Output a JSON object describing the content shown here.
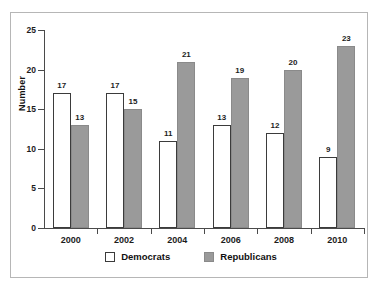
{
  "chart_data": {
    "type": "bar",
    "title": "",
    "subtitle": "",
    "xlabel": "",
    "ylabel": "Number",
    "categories": [
      "2000",
      "2002",
      "2004",
      "2006",
      "2008",
      "2010"
    ],
    "series": [
      {
        "name": "Democrats",
        "color": "#ffffff",
        "values": [
          17,
          17,
          11,
          13,
          12,
          9
        ]
      },
      {
        "name": "Republicans",
        "color": "#9a9a9a",
        "values": [
          13,
          15,
          21,
          19,
          20,
          23
        ]
      }
    ],
    "ylim": [
      0,
      25
    ],
    "yticks": [
      0,
      5,
      10,
      15,
      20,
      25
    ],
    "ytick_labels": [
      "0",
      "5",
      "10",
      "15",
      "20",
      "25"
    ],
    "grid": false,
    "legend_position": "bottom-center",
    "data_labels": true,
    "bar_grouping": "grouped",
    "annotations": []
  },
  "legend": {
    "items": [
      {
        "label": "Democrats",
        "swatch": "legend-swatch-democrats"
      },
      {
        "label": "Republicans",
        "swatch": "legend-swatch-republicans"
      }
    ]
  },
  "colors": {
    "democrats_fill": "#ffffff",
    "democrats_edge": "#3b3b3b",
    "republicans_fill": "#9a9a9a",
    "republicans_edge": "#8a8a8a",
    "axis": "#4a4a4a",
    "frame": "#b6b6b6",
    "text": "#1c1c1c"
  }
}
